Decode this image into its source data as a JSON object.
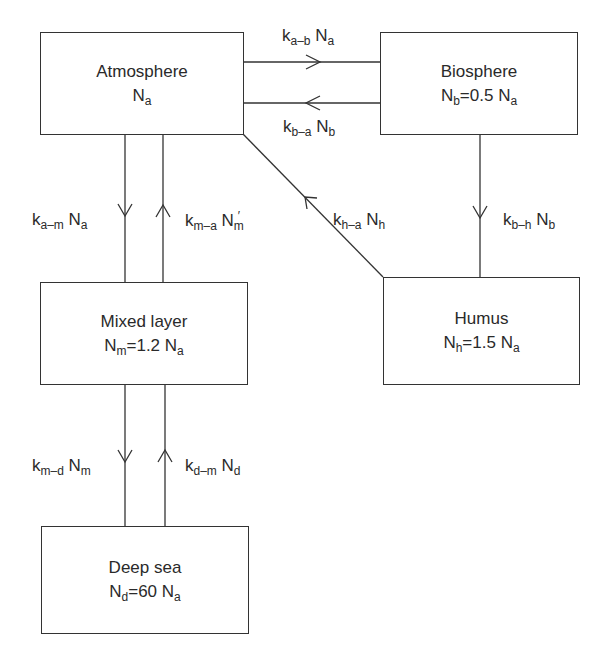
{
  "diagram": {
    "type": "box-model flow diagram (carbon reservoirs)",
    "line_color": "#333333",
    "background": "#ffffff"
  },
  "reservoirs": {
    "atmosphere": {
      "title": "Atmosphere",
      "sym": "N",
      "sym_sub": "a",
      "eq": "",
      "coef": "",
      "ref_sub": ""
    },
    "biosphere": {
      "title": "Biosphere",
      "sym": "N",
      "sym_sub": "b",
      "eq": "=",
      "coef": "0.5 N",
      "ref_sub": "a"
    },
    "mixed_layer": {
      "title": "Mixed layer",
      "sym": "N",
      "sym_sub": "m",
      "eq": "=",
      "coef": "1.2 N",
      "ref_sub": "a"
    },
    "humus": {
      "title": "Humus",
      "sym": "N",
      "sym_sub": "h",
      "eq": "=",
      "coef": "1.5 N",
      "ref_sub": "a"
    },
    "deep_sea": {
      "title": "Deep sea",
      "sym": "N",
      "sym_sub": "d",
      "eq": "=",
      "coef": "60 N",
      "ref_sub": "a"
    }
  },
  "fluxes": {
    "a_b": {
      "k": "k",
      "k_sub": "a–b",
      "n": "N",
      "n_sub": "a",
      "prime": "",
      "from": "Atmosphere",
      "to": "Biosphere"
    },
    "b_a": {
      "k": "k",
      "k_sub": "b–a",
      "n": "N",
      "n_sub": "b",
      "prime": "",
      "from": "Biosphere",
      "to": "Atmosphere"
    },
    "a_m": {
      "k": "k",
      "k_sub": "a–m",
      "n": "N",
      "n_sub": "a",
      "prime": "",
      "from": "Atmosphere",
      "to": "Mixed layer"
    },
    "m_a": {
      "k": "k",
      "k_sub": "m–a",
      "n": "N",
      "n_sub": "m",
      "prime": "′",
      "from": "Mixed layer",
      "to": "Atmosphere"
    },
    "h_a": {
      "k": "k",
      "k_sub": "h–a",
      "n": "N",
      "n_sub": "h",
      "prime": "",
      "from": "Humus",
      "to": "Atmosphere"
    },
    "b_h": {
      "k": "k",
      "k_sub": "b–h",
      "n": "N",
      "n_sub": "b",
      "prime": "",
      "from": "Biosphere",
      "to": "Humus"
    },
    "m_d": {
      "k": "k",
      "k_sub": "m–d",
      "n": "N",
      "n_sub": "m",
      "prime": "",
      "from": "Mixed layer",
      "to": "Deep sea"
    },
    "d_m": {
      "k": "k",
      "k_sub": "d–m",
      "n": "N",
      "n_sub": "d",
      "prime": "",
      "from": "Deep sea",
      "to": "Mixed layer"
    }
  }
}
